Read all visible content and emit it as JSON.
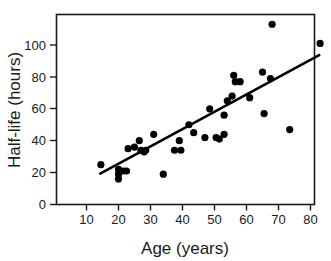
{
  "figure": {
    "background_color": "#ffffff",
    "foreground_color": "#1a1a1a",
    "marker_color": "#000000",
    "line_color": "#000000"
  },
  "axes": {
    "x_label": "Age (years)",
    "y_label": "Half-life (hours)",
    "x_ticks": [
      "10",
      "20",
      "30",
      "40",
      "50",
      "60",
      "70",
      "80"
    ],
    "y_ticks": [
      "0",
      "20",
      "40",
      "60",
      "80",
      "100"
    ]
  },
  "chart_data": {
    "type": "scatter",
    "title": "",
    "xlabel": "Age (years)",
    "ylabel": "Half-life (hours)",
    "xlim": [
      5,
      88
    ],
    "ylim": [
      0,
      118
    ],
    "xticks": [
      10,
      20,
      30,
      40,
      50,
      60,
      70,
      80
    ],
    "yticks": [
      0,
      20,
      40,
      60,
      80,
      100
    ],
    "grid": false,
    "legend": "none",
    "points": [
      {
        "x": 14.5,
        "y": 25
      },
      {
        "x": 20,
        "y": 22
      },
      {
        "x": 20,
        "y": 19
      },
      {
        "x": 20,
        "y": 16
      },
      {
        "x": 21.5,
        "y": 21
      },
      {
        "x": 22.5,
        "y": 21
      },
      {
        "x": 23,
        "y": 35
      },
      {
        "x": 25,
        "y": 36
      },
      {
        "x": 26.5,
        "y": 40
      },
      {
        "x": 27,
        "y": 34
      },
      {
        "x": 28,
        "y": 33
      },
      {
        "x": 28.5,
        "y": 34
      },
      {
        "x": 31,
        "y": 44
      },
      {
        "x": 34,
        "y": 19
      },
      {
        "x": 37.5,
        "y": 34
      },
      {
        "x": 39,
        "y": 40
      },
      {
        "x": 39.5,
        "y": 34
      },
      {
        "x": 42,
        "y": 50
      },
      {
        "x": 43.5,
        "y": 45
      },
      {
        "x": 47,
        "y": 42
      },
      {
        "x": 50.5,
        "y": 42
      },
      {
        "x": 51.5,
        "y": 41
      },
      {
        "x": 48.5,
        "y": 60
      },
      {
        "x": 53,
        "y": 44
      },
      {
        "x": 53,
        "y": 56
      },
      {
        "x": 54,
        "y": 65
      },
      {
        "x": 55.5,
        "y": 68
      },
      {
        "x": 56,
        "y": 81
      },
      {
        "x": 56.5,
        "y": 77
      },
      {
        "x": 58,
        "y": 77
      },
      {
        "x": 61,
        "y": 67
      },
      {
        "x": 65,
        "y": 83
      },
      {
        "x": 65.5,
        "y": 57
      },
      {
        "x": 67.5,
        "y": 79
      },
      {
        "x": 68,
        "y": 113
      },
      {
        "x": 73.5,
        "y": 47
      },
      {
        "x": 83,
        "y": 101
      }
    ],
    "fit_line": {
      "type": "linear regression",
      "x_start": 14.0,
      "y_start": 19.0,
      "x_end": 83.0,
      "y_end": 94.0
    }
  }
}
